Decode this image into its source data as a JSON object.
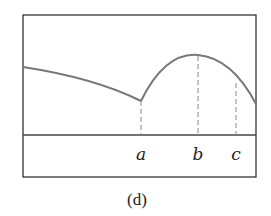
{
  "figure": {
    "caption": "(d)",
    "labels": {
      "a": "a",
      "b": "b",
      "c": "c"
    }
  },
  "colors": {
    "frame": "#333333",
    "curve": "#777777",
    "dashed": "#888888",
    "text": "#222222"
  },
  "geometry": {
    "box": {
      "x": 23,
      "y": 15,
      "w": 233,
      "h": 162
    },
    "baseline_y": 135,
    "curve_left": "M 23 67 Q 95 78 141 101",
    "curve_right": "M 141 101 Q 165 52 198 55 Q 232 58 256 104",
    "markers": [
      {
        "id": "a",
        "x": 141,
        "y_top": 101
      },
      {
        "id": "b",
        "x": 198,
        "y_top": 55
      },
      {
        "id": "c",
        "x": 236,
        "y_top": 82
      }
    ]
  }
}
